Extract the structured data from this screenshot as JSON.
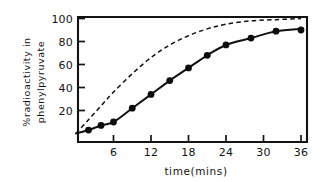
{
  "chart_data": {
    "type": "line",
    "title": "",
    "xlabel": "time(mins)",
    "ylabel": "%radioactivity in phenylpyruvate",
    "ylabel_line1": "%radioactivity in",
    "ylabel_line2": "phenylpyruvate",
    "xlim": [
      0,
      37
    ],
    "ylim": [
      0,
      104
    ],
    "grid": false,
    "legend": "none",
    "xticks": [
      6,
      12,
      18,
      24,
      30,
      36
    ],
    "xtick_labels": [
      "6",
      "12",
      "18",
      "24",
      "30",
      "36"
    ],
    "yticks": [
      20,
      40,
      60,
      80,
      100
    ],
    "ytick_labels": [
      "20",
      "40",
      "60",
      "80",
      "100"
    ],
    "series": [
      {
        "name": "observed-phenylpyruvate",
        "style": "solid-with-markers",
        "marker": "filled-circle",
        "x": [
          2,
          4,
          6,
          9,
          12,
          15,
          18,
          21,
          24,
          28,
          32,
          36
        ],
        "values": [
          3,
          7,
          10,
          22,
          34,
          46,
          57,
          68,
          77,
          83,
          89,
          90
        ],
        "curve_x": [
          0,
          2,
          4,
          6,
          9,
          12,
          15,
          18,
          21,
          24,
          28,
          32,
          36
        ],
        "curve_y": [
          0,
          3,
          7,
          10,
          22,
          34,
          46,
          57,
          68,
          77,
          83,
          89,
          91
        ]
      },
      {
        "name": "theoretical-curve",
        "style": "dashed",
        "marker": "none",
        "curve_x": [
          0,
          2,
          4,
          6,
          9,
          12,
          15,
          18,
          21,
          24,
          28,
          32,
          36
        ],
        "curve_y": [
          0,
          12,
          24,
          36,
          52,
          66,
          77,
          85,
          91,
          95,
          98,
          99,
          100
        ]
      }
    ]
  },
  "axes": {
    "x_axis_name": "time-axis",
    "y_axis_name": "radioactivity-axis"
  }
}
